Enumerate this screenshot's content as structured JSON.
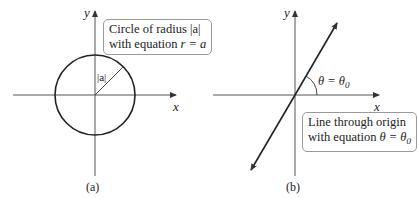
{
  "panel_a": {
    "caption": "(a)",
    "x_axis_label": "x",
    "y_axis_label": "y",
    "radius_label": "|a|",
    "callout": {
      "line1": "Circle of radius |a|",
      "line2_prefix": "with equation ",
      "line2_math": "r = a"
    }
  },
  "panel_b": {
    "caption": "(b)",
    "x_axis_label": "x",
    "y_axis_label": "y",
    "angle_label": "θ = θ",
    "angle_label_sub": "0",
    "callout": {
      "line1": "Line through origin",
      "line2_prefix": "with equation ",
      "line2_math": "θ = θ",
      "line2_sub": "0"
    }
  },
  "colors": {
    "curve": "#222222",
    "axis": "#555555",
    "box_border": "#9a9a9a"
  }
}
